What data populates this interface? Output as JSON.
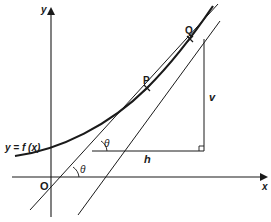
{
  "diagram": {
    "axes": {
      "x_label": "x",
      "y_label": "y",
      "origin_label": "O"
    },
    "curve": {
      "label": "y = f (x)"
    },
    "points": [
      {
        "id": "P",
        "label": "P"
      },
      {
        "id": "Q",
        "label": "Q"
      }
    ],
    "triangle": {
      "horizontal_label": "h",
      "vertical_label": "v",
      "right_angle": true
    },
    "angles": [
      {
        "label": "θ",
        "location": "chord meets h-line"
      },
      {
        "label": "θ",
        "location": "tangent-parallel line meets x-axis"
      }
    ],
    "colors": {
      "stroke": "#1a1a1a",
      "background": "#ffffff"
    }
  }
}
